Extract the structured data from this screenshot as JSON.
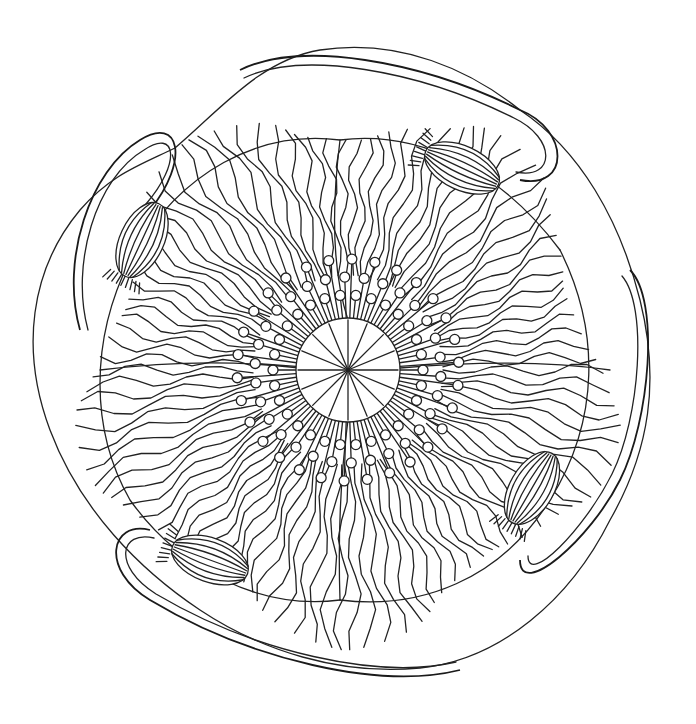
{
  "image": {
    "title": "Poppy mandala line art",
    "description": "Black-and-white coloring-page illustration of a large poppy flower viewed from above, with a central seed head surrounded by stamens, radiating veined petals, and four poppy seed pods on looping curved stems around the perimeter.",
    "style": "line-art",
    "colors": {
      "background": "#ffffff",
      "line": "#222222"
    },
    "elements": {
      "center": "ribbed seed-head disc with radial lines",
      "stamens": "ring of looped filaments with round anthers",
      "petals": "layered wavy petals with fine radial vein lines",
      "pods": [
        {
          "position": "upper-right",
          "cx": 462,
          "cy": 168
        },
        {
          "position": "upper-left",
          "cx": 142,
          "cy": 240
        },
        {
          "position": "lower-right",
          "cx": 532,
          "cy": 488
        },
        {
          "position": "lower-left",
          "cx": 210,
          "cy": 560
        }
      ],
      "stems": "four double-line looping stems framing the flower"
    }
  }
}
